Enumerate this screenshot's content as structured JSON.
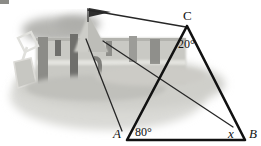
{
  "figure": {
    "background_description": "grayscale photo of a sandcastle with battlements, a pennant flag and a spade on sand",
    "colors": {
      "line": "#111111",
      "thin_line": "#3a3a3a",
      "label": "#111111",
      "sand_light": "#d8d8d4",
      "sand_mid": "#c4c4bf",
      "sand_dark": "#9a9a95",
      "castle_shadow": "#6f6f6c",
      "castle_dark": "#555553",
      "flag": "#2e2e2e",
      "page": "#ffffff"
    }
  },
  "labels": {
    "vertex_c": "C",
    "vertex_a": "A",
    "vertex_b": "B",
    "unknown_angle": "x",
    "angle_at_c": "20°",
    "angle_at_a": "80°"
  },
  "geometry": {
    "triangle": {
      "c": [
        187,
        26
      ],
      "a": [
        127,
        140
      ],
      "b": [
        245,
        140
      ]
    },
    "sight_lines": [
      {
        "name": "flag-to-c",
        "from": [
          88,
          10
        ],
        "to": [
          186,
          27
        ]
      },
      {
        "name": "castle-to-a",
        "from": [
          86,
          39
        ],
        "to": [
          122,
          131
        ]
      },
      {
        "name": "castle-to-x",
        "from": [
          103,
          41
        ],
        "to": [
          233,
          127
        ]
      }
    ]
  }
}
